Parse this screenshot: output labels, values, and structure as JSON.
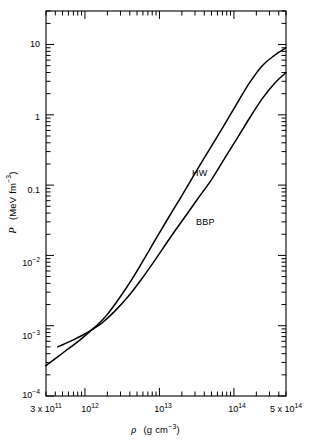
{
  "figure": {
    "background": "#ffffff",
    "ink_color": "#000000",
    "frame": {
      "left": 46,
      "right": 286,
      "top": 11,
      "bottom": 396
    }
  },
  "chart_data": {
    "type": "line",
    "title": "",
    "xlabel_plain": "ρ  (g cm−3)",
    "ylabel_plain": "P  (MeV fm−3)",
    "xscale": "log",
    "yscale": "log",
    "xlim": [
      300000000000.0,
      500000000000000.0
    ],
    "ylim": [
      0.0001,
      30
    ],
    "grid": false,
    "legend": "inline-curve-labels",
    "xtick_labels": [
      "3 x 10^11",
      "10^12",
      "10^13",
      "10^14",
      "5 x 10^14"
    ],
    "xtick_values": [
      300000000000.0,
      1000000000000.0,
      10000000000000.0,
      100000000000000.0,
      500000000000000.0
    ],
    "ytick_labels": [
      "10",
      "1",
      "0.1",
      "10^-2",
      "10^-3",
      "10^-4"
    ],
    "ytick_values": [
      10,
      1,
      0.1,
      0.01,
      0.001,
      0.0001
    ],
    "series": [
      {
        "name": "HW",
        "label": "HW",
        "color": "#000000",
        "x": [
          300000000000.0,
          400000000000.0,
          550000000000.0,
          750000000000.0,
          1000000000000.0,
          1400000000000.0,
          2000000000000.0,
          3000000000000.0,
          4500000000000.0,
          7000000000000.0,
          10000000000000.0,
          15000000000000.0,
          22000000000000.0,
          32000000000000.0,
          50000000000000.0,
          75000000000000.0,
          110000000000000.0,
          160000000000000.0,
          240000000000000.0,
          350000000000000.0,
          500000000000000.0
        ],
        "y": [
          0.00027,
          0.00034,
          0.00044,
          0.00056,
          0.00072,
          0.00098,
          0.00145,
          0.0026,
          0.005,
          0.011,
          0.021,
          0.043,
          0.084,
          0.165,
          0.36,
          0.73,
          1.45,
          2.8,
          5.0,
          7.0,
          9.0
        ]
      },
      {
        "name": "BBP",
        "label": "BBP",
        "color": "#000000",
        "x": [
          430000000000.0,
          550000000000.0,
          700000000000.0,
          900000000000.0,
          1200000000000.0,
          1700000000000.0,
          2500000000000.0,
          3800000000000.0,
          6000000000000.0,
          9000000000000.0,
          14000000000000.0,
          21000000000000.0,
          32000000000000.0,
          50000000000000.0,
          75000000000000.0,
          110000000000000.0,
          160000000000000.0,
          240000000000000.0,
          350000000000000.0,
          500000000000000.0
        ],
        "y": [
          0.0005,
          0.00056,
          0.00063,
          0.00072,
          0.00086,
          0.0011,
          0.0016,
          0.0026,
          0.0049,
          0.009,
          0.018,
          0.033,
          0.062,
          0.12,
          0.24,
          0.46,
          0.88,
          1.7,
          2.8,
          4.0
        ]
      }
    ],
    "annotations": [
      {
        "text": "HW",
        "x_px": 192,
        "y_px": 168
      },
      {
        "text": "BBP",
        "x_px": 196,
        "y_px": 217
      }
    ]
  },
  "axes": {
    "x_title_symbol": "ρ",
    "x_title_unit_pre": "(g cm",
    "x_title_unit_exp": "−3",
    "x_title_unit_post": ")",
    "y_title_symbol": "P",
    "y_title_unit_pre": "(MeV fm",
    "y_title_unit_exp": "−3",
    "y_title_unit_post": ")",
    "x_ticks": [
      {
        "label_pre": "3 x 10",
        "label_exp": "11",
        "x_px": 46
      },
      {
        "label_pre": "10",
        "label_exp": "12",
        "x_px": 90
      },
      {
        "label_pre": "10",
        "label_exp": "13",
        "x_px": 163
      },
      {
        "label_pre": "10",
        "label_exp": "14",
        "x_px": 237
      },
      {
        "label_pre": "5 x 10",
        "label_exp": "14",
        "x_px": 286
      }
    ],
    "y_ticks": [
      {
        "label_pre": "10",
        "label_exp": "",
        "y_px": 45
      },
      {
        "label_pre": "1",
        "label_exp": "",
        "y_px": 118
      },
      {
        "label_pre": "0.1",
        "label_exp": "",
        "y_px": 191
      },
      {
        "label_pre": "10",
        "label_exp": "−2",
        "y_px": 264
      },
      {
        "label_pre": "10",
        "label_exp": "−3",
        "y_px": 337
      },
      {
        "label_pre": "10",
        "label_exp": "−4",
        "y_px": 396
      }
    ]
  }
}
